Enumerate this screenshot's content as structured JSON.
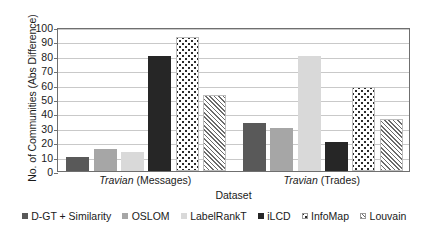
{
  "chart_data": {
    "type": "bar",
    "title": "",
    "xlabel": "Dataset",
    "ylabel": "No. of Communities (Abs Difference)",
    "categories": [
      "Travian (Messages)",
      "Travian (Trades)"
    ],
    "category_parts": [
      {
        "italic": "Travian",
        "rest": " (Messages)"
      },
      {
        "italic": "Travian",
        "rest": " (Trades)"
      }
    ],
    "ylim": [
      0,
      100
    ],
    "yticks": [
      0,
      10,
      20,
      30,
      40,
      50,
      60,
      70,
      80,
      90,
      100
    ],
    "ytick_labels": [
      "0",
      "10",
      "20",
      "30",
      "40",
      "50",
      "60",
      "70",
      "80",
      "90",
      "100"
    ],
    "grid": true,
    "legend_position": "bottom",
    "series": [
      {
        "name": "D-GT + Similarity",
        "values": [
          10,
          33
        ],
        "fill": "solid-dark",
        "color": "#595959"
      },
      {
        "name": "OSLOM",
        "values": [
          15,
          30
        ],
        "fill": "solid-mid",
        "color": "#a6a6a6"
      },
      {
        "name": "LabelRankT",
        "values": [
          13,
          80
        ],
        "fill": "solid-light",
        "color": "#d9d9d9"
      },
      {
        "name": "iLCD",
        "values": [
          80,
          20
        ],
        "fill": "solid-black",
        "color": "#262626"
      },
      {
        "name": "InfoMap",
        "values": [
          93,
          58
        ],
        "fill": "dots",
        "color": "#ffffff"
      },
      {
        "name": "Louvain",
        "values": [
          53,
          36
        ],
        "fill": "hatch",
        "color": "#ffffff"
      }
    ]
  },
  "axis": {
    "y_title": "No. of Communities (Abs Difference)",
    "x_title": "Dataset"
  }
}
